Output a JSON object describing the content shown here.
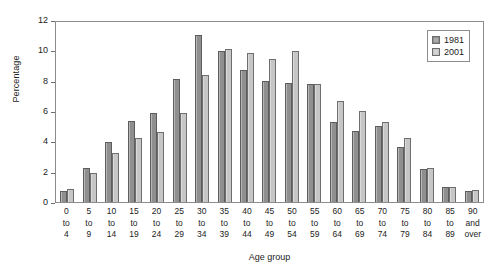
{
  "chart_data": {
    "type": "bar",
    "title": "",
    "xlabel": "Age group",
    "ylabel": "Percentage",
    "ylim": [
      0,
      12
    ],
    "yticks": [
      0,
      2,
      4,
      6,
      8,
      10,
      12
    ],
    "grid": false,
    "legend_position": "top-right",
    "categories": [
      "0 to 4",
      "5 to 9",
      "10 to 14",
      "15 to 19",
      "20 to 24",
      "25 to 29",
      "30 to 34",
      "35 to 39",
      "40 to 44",
      "45 to 49",
      "50 to 54",
      "55 to 59",
      "60 to 64",
      "65 to 69",
      "70 to 74",
      "75 to 79",
      "80 to 84",
      "85 to 89",
      "90 and over"
    ],
    "category_lines": [
      [
        "0",
        "to",
        "4"
      ],
      [
        "5",
        "to",
        "9"
      ],
      [
        "10",
        "to",
        "14"
      ],
      [
        "15",
        "to",
        "19"
      ],
      [
        "20",
        "to",
        "24"
      ],
      [
        "25",
        "to",
        "29"
      ],
      [
        "30",
        "to",
        "34"
      ],
      [
        "35",
        "to",
        "39"
      ],
      [
        "40",
        "to",
        "44"
      ],
      [
        "45",
        "to",
        "49"
      ],
      [
        "50",
        "to",
        "54"
      ],
      [
        "55",
        "to",
        "59"
      ],
      [
        "60",
        "to",
        "64"
      ],
      [
        "65",
        "to",
        "69"
      ],
      [
        "70",
        "to",
        "74"
      ],
      [
        "75",
        "to",
        "79"
      ],
      [
        "80",
        "to",
        "84"
      ],
      [
        "85",
        "to",
        "89"
      ],
      [
        "90",
        "and",
        "over"
      ]
    ],
    "series": [
      {
        "name": "1981",
        "color": "#8f8f8f",
        "values": [
          0.7,
          2.25,
          3.95,
          5.35,
          5.85,
          8.1,
          11.0,
          9.95,
          8.7,
          8.0,
          7.85,
          7.75,
          5.25,
          4.7,
          5.0,
          3.65,
          2.15,
          1.0,
          0.7
        ]
      },
      {
        "name": "2001",
        "color": "#c6c6c6",
        "values": [
          0.85,
          1.9,
          3.25,
          4.25,
          4.6,
          5.85,
          8.35,
          10.1,
          9.8,
          9.45,
          9.95,
          7.75,
          6.65,
          6.0,
          5.3,
          4.25,
          2.25,
          1.0,
          0.8
        ]
      }
    ]
  },
  "legend": {
    "items": [
      {
        "label": "1981"
      },
      {
        "label": "2001"
      }
    ]
  },
  "axes": {
    "y_label": "Percentage",
    "x_label": "Age group"
  }
}
